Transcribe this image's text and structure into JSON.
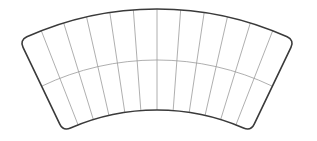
{
  "diagram": {
    "type": "curved-grid-sector",
    "canvas": {
      "width": 317,
      "height": 141,
      "background": "#ffffff"
    },
    "geometry": {
      "center_x": 157,
      "center_y": 327,
      "outer_radius": 318,
      "middle_radius": 267,
      "inner_radius": 217,
      "half_angle_deg": 25.6,
      "corner_radius": 8
    },
    "grid": {
      "rows": 2,
      "columns": 12
    },
    "colors": {
      "outline": "#3a3a3a",
      "grid_lines": "#9a9a9a"
    },
    "stroke": {
      "outline_width": 1.6,
      "grid_width": 0.8
    }
  }
}
